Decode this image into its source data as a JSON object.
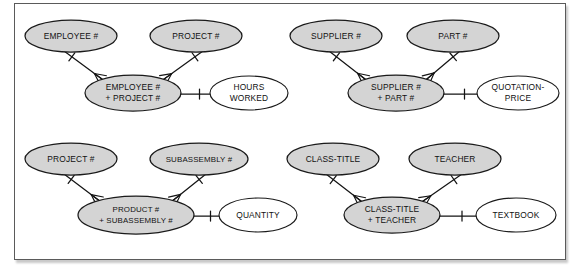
{
  "figure": {
    "type": "entity-relationship-diagram",
    "notation": "crows-foot",
    "background_color": "#ffffff",
    "frame_border_color": "#5a5a5a",
    "key_entity_fill": "#d4d4d4",
    "attribute_fill": "#ffffff",
    "line_color": "#141414"
  },
  "groups": [
    {
      "id": "employee-project",
      "parents": [
        {
          "label": "EMPLOYEE #",
          "cx": 71,
          "cy": 36,
          "rx": 46,
          "ry": 16
        },
        {
          "label": "PROJECT #",
          "cx": 196,
          "cy": 36,
          "rx": 46,
          "ry": 16
        }
      ],
      "child": {
        "line1": "EMPLOYEE #",
        "line2": "+ PROJECT #",
        "cx": 133,
        "cy": 93,
        "rx": 48,
        "ry": 18
      },
      "attribute": {
        "line1": "HOURS",
        "line2": "WORKED",
        "cx": 249,
        "cy": 93,
        "rx": 39,
        "ry": 17
      }
    },
    {
      "id": "supplier-part",
      "parents": [
        {
          "label": "SUPPLIER #",
          "cx": 336,
          "cy": 36,
          "rx": 46,
          "ry": 16
        },
        {
          "label": "PART #",
          "cx": 453,
          "cy": 36,
          "rx": 46,
          "ry": 16
        }
      ],
      "child": {
        "line1": "SUPPLIER #",
        "line2": "+ PART #",
        "cx": 396,
        "cy": 93,
        "rx": 48,
        "ry": 18
      },
      "attribute": {
        "line1": "QUOTATION-",
        "line2": "PRICE",
        "cx": 518,
        "cy": 93,
        "rx": 41,
        "ry": 17
      }
    },
    {
      "id": "product-subassembly",
      "parents": [
        {
          "label": "PROJECT #",
          "cx": 71,
          "cy": 159,
          "rx": 46,
          "ry": 16
        },
        {
          "label": "SUBASSEMBLY #",
          "cx": 199,
          "cy": 159,
          "rx": 49,
          "ry": 16
        }
      ],
      "child": {
        "line1": "PRODUCT #",
        "line2": "+ SUBASSEMBLY #",
        "cx": 136,
        "cy": 215,
        "rx": 58,
        "ry": 19
      },
      "attribute": {
        "line1": "QUANTITY",
        "line2": "",
        "cx": 258,
        "cy": 215,
        "rx": 39,
        "ry": 17
      }
    },
    {
      "id": "class-teacher",
      "parents": [
        {
          "label": "CLASS-TITLE",
          "cx": 333,
          "cy": 159,
          "rx": 46,
          "ry": 16
        },
        {
          "label": "TEACHER",
          "cx": 455,
          "cy": 159,
          "rx": 46,
          "ry": 16
        }
      ],
      "child": {
        "line1": "CLASS-TITLE",
        "line2": "+ TEACHER",
        "cx": 392,
        "cy": 215,
        "rx": 48,
        "ry": 18
      },
      "attribute": {
        "line1": "TEXTBOOK",
        "line2": "",
        "cx": 516,
        "cy": 215,
        "rx": 40,
        "ry": 17
      }
    }
  ]
}
